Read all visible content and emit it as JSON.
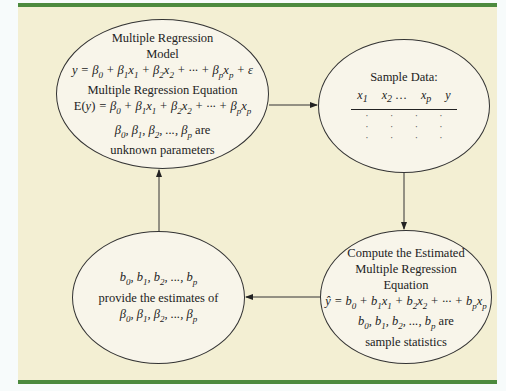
{
  "diagram": {
    "colors": {
      "panel_bg": "#f3efd3",
      "accent_bar": "#4c8a3e",
      "node_bg": "#f8f5ea",
      "stroke": "#333333"
    },
    "nodes": [
      {
        "id": "model",
        "lines": [
          "Multiple Regression",
          "Model",
          "y = β0 + β1x1 + β2x2 + ··· + βpxp + ε",
          "Multiple Regression Equation",
          "E(y) = β0 + β1x1 + β2x2 + ··· + βpxp",
          "β0, β1, β2, ..., βp are",
          "unknown parameters"
        ]
      },
      {
        "id": "sample",
        "title": "Sample Data:",
        "columns": [
          "x1",
          "x2 ...",
          "xp",
          "y"
        ],
        "rows": [
          [
            ".",
            ".",
            ".",
            "."
          ],
          [
            ".",
            ".",
            ".",
            "."
          ],
          [
            ".",
            ".",
            ".",
            "."
          ]
        ]
      },
      {
        "id": "compute",
        "lines": [
          "Compute the Estimated",
          "Multiple Regression",
          "Equation",
          "ŷ = b0 + b1x1 + b2x2 + ··· + bpxp",
          "b0, b1, b2, ..., bp are",
          "sample statistics"
        ]
      },
      {
        "id": "estimates",
        "lines": [
          "b0, b1, b2, ..., bp",
          "provide the estimates of",
          "β0, β1, β2, ..., βp"
        ]
      }
    ],
    "edges": [
      {
        "from": "model",
        "to": "sample",
        "direction": "right"
      },
      {
        "from": "sample",
        "to": "compute",
        "direction": "down"
      },
      {
        "from": "compute",
        "to": "estimates",
        "direction": "left"
      },
      {
        "from": "estimates",
        "to": "model",
        "direction": "up"
      }
    ]
  },
  "text": {
    "model_title1": "Multiple Regression",
    "model_title2": "Model",
    "model_eq_label": "Multiple Regression Equation",
    "model_params_tail": " are",
    "model_params_line2": "unknown parameters",
    "sample_title": "Sample Data:",
    "compute_l1": "Compute the Estimated",
    "compute_l2": "Multiple Regression",
    "compute_l3": "Equation",
    "compute_tail": " are",
    "compute_l6": "sample statistics",
    "est_l2": "provide the estimates of"
  }
}
